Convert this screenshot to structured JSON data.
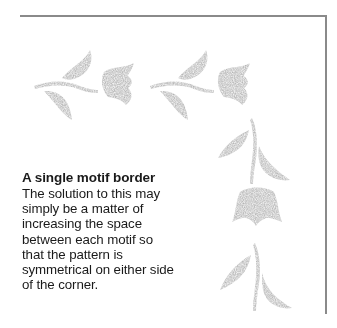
{
  "caption": {
    "title": "A single motif border",
    "body_lines": [
      "The solution to this may",
      "simply be a matter of",
      "increasing the space",
      "between each motif so",
      "that the pattern is",
      "symmetrical on either side",
      "of the corner."
    ]
  },
  "illustration": {
    "motif_color": "#b5b5b5",
    "frame_color": "#8a8a8a",
    "motifs": [
      {
        "name": "tulip-motif-horizontal-1",
        "orientation": "horizontal"
      },
      {
        "name": "tulip-motif-horizontal-2",
        "orientation": "horizontal"
      },
      {
        "name": "leaf-motif-vertical-corner",
        "orientation": "vertical"
      },
      {
        "name": "tulip-head-vertical",
        "orientation": "vertical"
      },
      {
        "name": "leaf-motif-vertical-2",
        "orientation": "vertical"
      }
    ]
  }
}
